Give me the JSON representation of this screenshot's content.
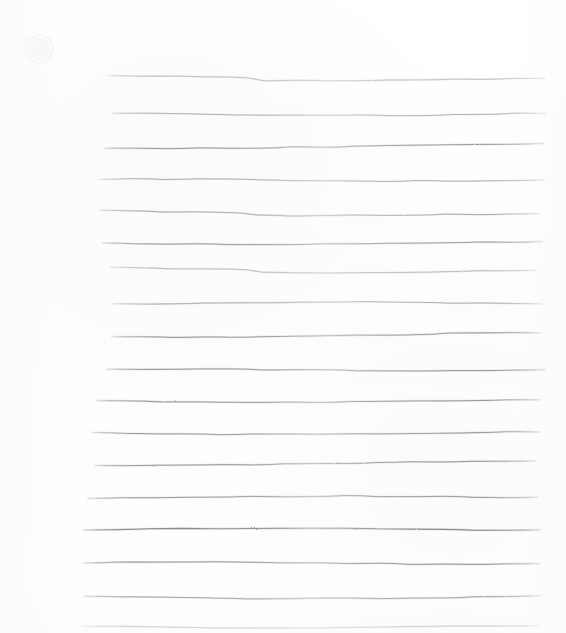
{
  "document": {
    "kind": "scanned-blank-ruled-page",
    "title": "Blank Ruled Page",
    "page_width": 566,
    "page_height": 633,
    "background_color": "#fefefe",
    "content_text": "",
    "visible_text_count": 0
  },
  "watermark": {
    "name": "rosette-ornament",
    "position": "top-left",
    "x": 16,
    "y": 26,
    "size": 46,
    "opacity": 0.055,
    "color": "#9aa0a6"
  },
  "ruling": {
    "line_count": 17,
    "orientation": "horizontal",
    "style": "hand-drawn-wavy",
    "spacing_px": 33,
    "first_line_y": 78,
    "color_light": "#b4b4b4",
    "color_mid": "#9a9a9a",
    "color_dark": "#7d7d7d",
    "left_margin_x": 82,
    "right_margin_x": 545,
    "lines": [
      {
        "index": 1,
        "y": 78,
        "x_start": 108,
        "x_end": 545,
        "stroke": "#a8a8a8",
        "width": 0.9,
        "opacity": 0.8,
        "wave": "dip-left"
      },
      {
        "index": 2,
        "y": 113,
        "x_start": 112,
        "x_end": 546,
        "stroke": "#9e9e9e",
        "width": 0.9,
        "opacity": 0.85,
        "wave": "dip-mid"
      },
      {
        "index": 3,
        "y": 148,
        "x_start": 104,
        "x_end": 543,
        "stroke": "#8f8f8f",
        "width": 1.0,
        "opacity": 0.9,
        "wave": "rise-right"
      },
      {
        "index": 4,
        "y": 180,
        "x_start": 100,
        "x_end": 544,
        "stroke": "#9a9a9a",
        "width": 0.9,
        "opacity": 0.85,
        "wave": "flat"
      },
      {
        "index": 5,
        "y": 213,
        "x_start": 100,
        "x_end": 540,
        "stroke": "#959595",
        "width": 0.9,
        "opacity": 0.85,
        "wave": "dip-left"
      },
      {
        "index": 6,
        "y": 243,
        "x_start": 103,
        "x_end": 542,
        "stroke": "#909090",
        "width": 1.0,
        "opacity": 0.88,
        "wave": "fade-mid"
      },
      {
        "index": 7,
        "y": 270,
        "x_start": 110,
        "x_end": 536,
        "stroke": "#a4a4a4",
        "width": 0.9,
        "opacity": 0.8,
        "wave": "dip-left"
      },
      {
        "index": 8,
        "y": 303,
        "x_start": 113,
        "x_end": 542,
        "stroke": "#999999",
        "width": 0.9,
        "opacity": 0.85,
        "wave": "flat"
      },
      {
        "index": 9,
        "y": 337,
        "x_start": 112,
        "x_end": 540,
        "stroke": "#8d8d8d",
        "width": 1.0,
        "opacity": 0.9,
        "wave": "rise-right"
      },
      {
        "index": 10,
        "y": 370,
        "x_start": 107,
        "x_end": 545,
        "stroke": "#8b8b8b",
        "width": 1.0,
        "opacity": 0.9,
        "wave": "flat"
      },
      {
        "index": 11,
        "y": 401,
        "x_start": 97,
        "x_end": 540,
        "stroke": "#8c8c8c",
        "width": 1.0,
        "opacity": 0.9,
        "wave": "fade-mid"
      },
      {
        "index": 12,
        "y": 433,
        "x_start": 92,
        "x_end": 540,
        "stroke": "#8e8e8e",
        "width": 1.0,
        "opacity": 0.88,
        "wave": "fade-mid"
      },
      {
        "index": 13,
        "y": 465,
        "x_start": 95,
        "x_end": 535,
        "stroke": "#8a8a8a",
        "width": 1.0,
        "opacity": 0.88,
        "wave": "rise-right"
      },
      {
        "index": 14,
        "y": 497,
        "x_start": 88,
        "x_end": 538,
        "stroke": "#8d8d8d",
        "width": 1.0,
        "opacity": 0.88,
        "wave": "flat"
      },
      {
        "index": 15,
        "y": 529,
        "x_start": 84,
        "x_end": 540,
        "stroke": "#7f7f7f",
        "width": 1.1,
        "opacity": 0.92,
        "wave": "flat"
      },
      {
        "index": 16,
        "y": 563,
        "x_start": 84,
        "x_end": 540,
        "stroke": "#888888",
        "width": 1.0,
        "opacity": 0.9,
        "wave": "flat"
      },
      {
        "index": 17,
        "y": 596,
        "x_start": 84,
        "x_end": 540,
        "stroke": "#909090",
        "width": 1.0,
        "opacity": 0.88,
        "wave": "dip-mid"
      },
      {
        "index": 18,
        "y": 627,
        "x_start": 82,
        "x_end": 538,
        "stroke": "#a2a2a2",
        "width": 0.9,
        "opacity": 0.78,
        "wave": "flat"
      }
    ]
  }
}
